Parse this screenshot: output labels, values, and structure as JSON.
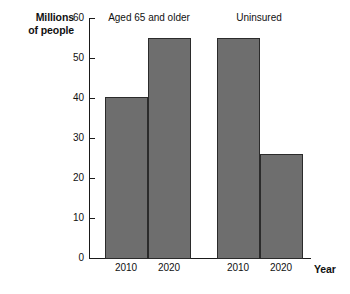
{
  "chart_data": {
    "type": "bar",
    "title": "",
    "xlabel": "Year",
    "ylabel": "Millions of people",
    "ylabel_lines": [
      "Millions",
      "of people"
    ],
    "ylim": [
      0,
      60
    ],
    "yticks": [
      0,
      10,
      20,
      30,
      40,
      50,
      60
    ],
    "ytick_labels": [
      "0",
      "10",
      "20",
      "30",
      "40",
      "50",
      "60"
    ],
    "grid": false,
    "legend": "none",
    "bar_color": "#6e6e6e",
    "bar_edge_color": "#2b2b2b",
    "axis_color": "#1a1a1a",
    "groups": [
      {
        "label": "Aged 65 and older",
        "categories": [
          "2010",
          "2020"
        ],
        "values": [
          40.4,
          55.0
        ]
      },
      {
        "label": "Uninsured",
        "categories": [
          "2010",
          "2020"
        ],
        "values": [
          55.0,
          26.1
        ]
      }
    ],
    "categories": [
      "2010",
      "2020",
      "2010",
      "2020"
    ],
    "values": [
      40.4,
      55.0,
      55.0,
      26.1
    ]
  }
}
